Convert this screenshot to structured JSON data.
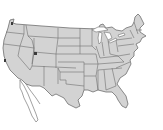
{
  "map": {
    "title": "United States state map",
    "fill_color": "#d3d3d3",
    "border_color": "#6f6f6f",
    "background_color": "#ffffff",
    "markers": [
      {
        "name": "seattle-marker",
        "x": 12,
        "y": 23
      },
      {
        "name": "bay-area-marker",
        "x": 5,
        "y": 60
      },
      {
        "name": "salt-lake-marker",
        "x": 35,
        "y": 53
      }
    ]
  }
}
